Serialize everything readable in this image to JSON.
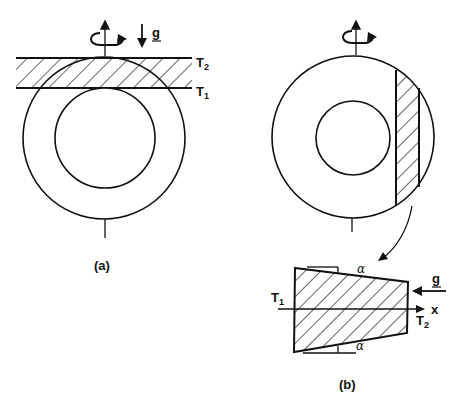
{
  "figure_a": {
    "caption": "(a)",
    "label_top": "T",
    "label_top_sub": "2",
    "label_bottom": "T",
    "label_bottom_sub": "1",
    "gravity_label": "g",
    "rotation_icon": "rotation-arrow-icon"
  },
  "figure_b": {
    "caption": "(b)",
    "label_left": "T",
    "label_left_sub": "1",
    "label_right": "T",
    "label_right_sub": "2",
    "axis_label": "x",
    "gravity_label": "g",
    "angle_top": "α",
    "angle_bottom": "α",
    "rotation_icon": "rotation-arrow-icon"
  },
  "colors": {
    "stroke": "#111111",
    "background": "#ffffff"
  }
}
